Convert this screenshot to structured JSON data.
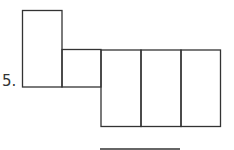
{
  "problem": {
    "number": "5.",
    "figure": "net of rectangular prism made of six rectangles",
    "answer_blank": ""
  },
  "colors": {
    "stroke": "#333333",
    "background": "#ffffff"
  }
}
